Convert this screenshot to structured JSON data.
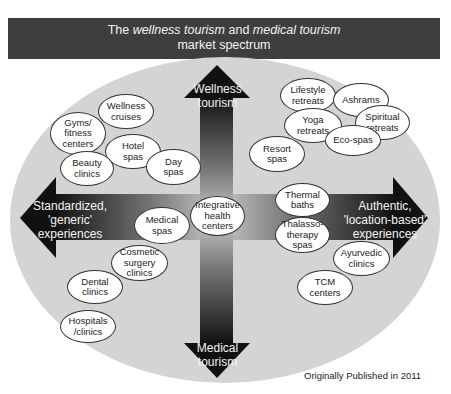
{
  "header": {
    "title_prefix": "The ",
    "title_em1": "wellness tourism",
    "title_mid": " and ",
    "title_em2": "medical tourism",
    "title_line2": "market spectrum"
  },
  "axes": {
    "top": "Wellness\ntourism",
    "bottom": "Medical\ntourism",
    "left": "Standardized,\n'generic'\nexperiences",
    "right": "Authentic,\n'location-based'\nexperiences"
  },
  "bubbles": [
    {
      "id": "wellness-cruises",
      "label": "Wellness\ncruises"
    },
    {
      "id": "gyms-fitness-centers",
      "label": "Gyms/\nfitness\ncenters"
    },
    {
      "id": "hotel-spas",
      "label": "Hotel\nspas"
    },
    {
      "id": "beauty-clinics",
      "label": "Beauty\nclinics"
    },
    {
      "id": "day-spas",
      "label": "Day\nspas"
    },
    {
      "id": "lifestyle-retreats",
      "label": "Lifestyle\nretreats"
    },
    {
      "id": "ashrams",
      "label": "Ashrams"
    },
    {
      "id": "yoga-retreats",
      "label": "Yoga\nretreats"
    },
    {
      "id": "spiritual-retreats",
      "label": "Spiritual\nretreats"
    },
    {
      "id": "eco-spas",
      "label": "Eco-spas"
    },
    {
      "id": "resort-spas",
      "label": "Resort\nspas"
    },
    {
      "id": "integrative-health-centers",
      "label": "Integrative\nhealth\ncenters"
    },
    {
      "id": "medical-spas",
      "label": "Medical\nspas"
    },
    {
      "id": "cosmetic-surgery-clinics",
      "label": "Cosmetic\nsurgery\nclinics"
    },
    {
      "id": "dental-clinics",
      "label": "Dental\nclinics"
    },
    {
      "id": "hospitals-clinics",
      "label": "Hospitals\n/clinics"
    },
    {
      "id": "thermal-baths",
      "label": "Thermal\nbaths"
    },
    {
      "id": "thalassotherapy-spas",
      "label": "Thalasso-\ntherapy\nspas"
    },
    {
      "id": "ayurvedic-clinics",
      "label": "Ayurvedic\nclinics"
    },
    {
      "id": "tcm-centers",
      "label": "TCM\ncenters"
    }
  ],
  "footer": "Originally Published in 2011",
  "colors": {
    "header_bg": "#3e3e3e",
    "spectrum_bg": "#d4d4d4",
    "arrow_dark": "#111111"
  }
}
